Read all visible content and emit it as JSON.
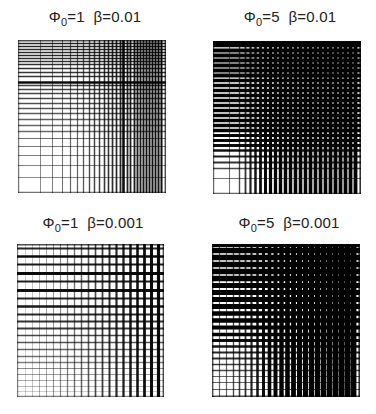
{
  "figure": {
    "panels": [
      {
        "id": "p1",
        "title": {
          "phi_symbol": "Φ",
          "phi_sub": "0",
          "phi_value": "=1",
          "beta": "β=0.01"
        },
        "phi0": 1,
        "beta": 0.01,
        "box": {
          "left": 18,
          "top": 40,
          "width": 148,
          "height": 153
        },
        "title_pos": {
          "left": 0,
          "top": 8
        },
        "v_lines": [
          [
            0,
            1.2,
            0.55
          ],
          [
            22,
            1.0,
            0.45
          ],
          [
            34,
            1.0,
            0.5
          ],
          [
            44,
            1.0,
            0.55
          ],
          [
            52,
            1.2,
            0.6
          ],
          [
            59,
            1.2,
            0.62
          ],
          [
            65,
            1.3,
            0.65
          ],
          [
            71,
            1.4,
            0.7
          ],
          [
            76,
            1.5,
            0.72
          ],
          [
            81,
            1.5,
            0.75
          ],
          [
            86,
            1.6,
            0.78
          ],
          [
            90,
            1.6,
            0.8
          ],
          [
            94,
            1.7,
            0.82
          ],
          [
            98,
            1.7,
            0.84
          ],
          [
            102,
            1.8,
            0.85
          ],
          [
            105,
            2.6,
            0.95
          ],
          [
            109,
            1.8,
            0.86
          ],
          [
            112,
            1.8,
            0.87
          ],
          [
            116,
            1.9,
            0.88
          ],
          [
            119,
            1.9,
            0.9
          ],
          [
            122,
            1.9,
            0.9
          ],
          [
            125,
            2.0,
            0.9
          ],
          [
            128,
            2.0,
            0.92
          ],
          [
            131,
            2.0,
            0.92
          ],
          [
            134,
            2.0,
            0.93
          ],
          [
            137,
            2.0,
            0.93
          ],
          [
            140,
            2.0,
            0.94
          ],
          [
            143,
            2.0,
            0.94
          ],
          [
            147,
            1.4,
            0.7
          ]
        ],
        "h_lines": [
          [
            0,
            1.4,
            0.7
          ],
          [
            3,
            1.6,
            0.85
          ],
          [
            6,
            1.6,
            0.85
          ],
          [
            9,
            1.6,
            0.84
          ],
          [
            12,
            1.6,
            0.83
          ],
          [
            15,
            1.6,
            0.83
          ],
          [
            18,
            1.6,
            0.82
          ],
          [
            21,
            1.6,
            0.8
          ],
          [
            24,
            1.6,
            0.8
          ],
          [
            28,
            1.6,
            0.8
          ],
          [
            32,
            1.6,
            0.78
          ],
          [
            36,
            1.6,
            0.78
          ],
          [
            42,
            2.6,
            0.95
          ],
          [
            45,
            1.5,
            0.75
          ],
          [
            49,
            1.5,
            0.72
          ],
          [
            53,
            1.5,
            0.72
          ],
          [
            58,
            1.5,
            0.7
          ],
          [
            63,
            1.5,
            0.68
          ],
          [
            68,
            1.4,
            0.66
          ],
          [
            73,
            1.4,
            0.64
          ],
          [
            79,
            1.4,
            0.62
          ],
          [
            85,
            1.3,
            0.6
          ],
          [
            91,
            1.3,
            0.58
          ],
          [
            98,
            1.2,
            0.55
          ],
          [
            106,
            1.2,
            0.52
          ],
          [
            115,
            1.1,
            0.5
          ],
          [
            125,
            1.0,
            0.48
          ],
          [
            137,
            1.0,
            0.45
          ],
          [
            152,
            1.2,
            0.55
          ]
        ]
      },
      {
        "id": "p2",
        "title": {
          "phi_symbol": "Φ",
          "phi_sub": "0",
          "phi_value": "=5",
          "beta": "β=0.01"
        },
        "phi0": 5,
        "beta": 0.01,
        "box": {
          "left": 213,
          "top": 41,
          "width": 148,
          "height": 153
        },
        "title_pos": {
          "left": 195,
          "top": 8
        },
        "v_lines": [
          [
            0,
            1.2,
            0.6
          ],
          [
            16,
            1.0,
            0.55
          ],
          [
            26,
            1.4,
            0.7
          ],
          [
            32,
            1.8,
            0.8
          ],
          [
            37,
            2.2,
            0.88
          ],
          [
            42,
            2.5,
            0.92
          ],
          [
            47,
            2.8,
            0.95
          ],
          [
            52,
            3.0,
            0.97
          ],
          [
            57,
            3.2,
            1
          ],
          [
            62,
            3.3,
            1
          ],
          [
            67,
            3.4,
            1
          ],
          [
            72,
            3.5,
            1
          ],
          [
            77,
            3.5,
            1
          ],
          [
            82,
            3.6,
            1
          ],
          [
            87,
            3.6,
            1
          ],
          [
            92,
            3.6,
            1
          ],
          [
            97,
            3.7,
            1
          ],
          [
            102,
            3.7,
            1
          ],
          [
            107,
            3.7,
            1
          ],
          [
            112,
            3.7,
            1
          ],
          [
            117,
            3.8,
            1
          ],
          [
            122,
            3.8,
            1
          ],
          [
            127,
            3.8,
            1
          ],
          [
            132,
            3.8,
            1
          ],
          [
            137,
            3.8,
            1
          ],
          [
            142,
            3.8,
            1
          ],
          [
            147,
            1.6,
            0.8
          ]
        ],
        "h_lines": [
          [
            0,
            3.0,
            1
          ],
          [
            4,
            3.6,
            1
          ],
          [
            9,
            3.8,
            1
          ],
          [
            14,
            3.8,
            1
          ],
          [
            19,
            3.8,
            1
          ],
          [
            24,
            3.8,
            1
          ],
          [
            29,
            3.8,
            1
          ],
          [
            34,
            3.8,
            1
          ],
          [
            39,
            3.7,
            1
          ],
          [
            44,
            3.7,
            1
          ],
          [
            49,
            3.7,
            1
          ],
          [
            54,
            3.7,
            1
          ],
          [
            59,
            3.6,
            1
          ],
          [
            64,
            3.6,
            1
          ],
          [
            69,
            3.6,
            1
          ],
          [
            74,
            3.5,
            1
          ],
          [
            79,
            3.5,
            1
          ],
          [
            84,
            3.4,
            1
          ],
          [
            89,
            3.3,
            1
          ],
          [
            94,
            3.2,
            1
          ],
          [
            99,
            3.0,
            0.97
          ],
          [
            104,
            2.8,
            0.95
          ],
          [
            109,
            2.5,
            0.92
          ],
          [
            115,
            2.2,
            0.88
          ],
          [
            121,
            1.8,
            0.8
          ],
          [
            127,
            1.4,
            0.7
          ],
          [
            137,
            1.0,
            0.55
          ],
          [
            152,
            1.2,
            0.6
          ]
        ]
      },
      {
        "id": "p3",
        "title": {
          "phi_symbol": "Φ",
          "phi_sub": "0",
          "phi_value": "=1",
          "beta": "β=0.001"
        },
        "phi0": 1,
        "beta": 0.001,
        "box": {
          "left": 17,
          "top": 244,
          "width": 147,
          "height": 153
        },
        "title_pos": {
          "left": -2,
          "top": 214
        },
        "v_lines": [
          [
            0,
            1.2,
            0.5
          ],
          [
            8,
            0.9,
            0.2
          ],
          [
            15,
            0.9,
            0.25
          ],
          [
            22,
            1.0,
            0.3
          ],
          [
            29,
            1.0,
            0.35
          ],
          [
            36,
            1.1,
            0.4
          ],
          [
            43,
            1.2,
            0.45
          ],
          [
            50,
            1.3,
            0.5
          ],
          [
            57,
            1.4,
            0.55
          ],
          [
            64,
            1.5,
            0.6
          ],
          [
            71,
            1.6,
            0.65
          ],
          [
            78,
            1.7,
            0.7
          ],
          [
            85,
            1.8,
            0.75
          ],
          [
            92,
            2.0,
            0.8
          ],
          [
            99,
            2.2,
            0.84
          ],
          [
            106,
            2.3,
            0.88
          ],
          [
            113,
            2.5,
            0.9
          ],
          [
            120,
            2.6,
            0.92
          ],
          [
            127,
            2.8,
            0.94
          ],
          [
            134,
            3.0,
            0.95
          ],
          [
            141,
            3.2,
            0.96
          ],
          [
            146,
            1.4,
            0.7
          ]
        ],
        "h_lines": [
          [
            0,
            1.4,
            0.7
          ],
          [
            4,
            2.0,
            0.85
          ],
          [
            12,
            2.6,
            0.95
          ],
          [
            20,
            2.2,
            0.9
          ],
          [
            29,
            3.0,
            0.96
          ],
          [
            37,
            2.2,
            0.88
          ],
          [
            46,
            2.8,
            0.94
          ],
          [
            54,
            2.0,
            0.85
          ],
          [
            62,
            2.4,
            0.9
          ],
          [
            70,
            2.0,
            0.84
          ],
          [
            77,
            2.0,
            0.8
          ],
          [
            84,
            1.8,
            0.76
          ],
          [
            91,
            1.7,
            0.72
          ],
          [
            98,
            1.6,
            0.66
          ],
          [
            105,
            1.5,
            0.6
          ],
          [
            112,
            1.4,
            0.55
          ],
          [
            118,
            1.3,
            0.5
          ],
          [
            124,
            1.2,
            0.45
          ],
          [
            130,
            1.1,
            0.38
          ],
          [
            136,
            1.0,
            0.32
          ],
          [
            142,
            1.0,
            0.28
          ],
          [
            147,
            0.9,
            0.22
          ],
          [
            152,
            1.2,
            0.5
          ]
        ]
      },
      {
        "id": "p4",
        "title": {
          "phi_symbol": "Φ",
          "phi_sub": "0",
          "phi_value": "=5",
          "beta": "β=0.001"
        },
        "phi0": 5,
        "beta": 0.001,
        "box": {
          "left": 212,
          "top": 244,
          "width": 148,
          "height": 153
        },
        "title_pos": {
          "left": 194,
          "top": 214
        },
        "v_lines": [
          [
            0,
            1.4,
            0.7
          ],
          [
            7,
            1.2,
            0.6
          ],
          [
            14,
            1.2,
            0.6
          ],
          [
            21,
            1.4,
            0.7
          ],
          [
            27,
            1.6,
            0.75
          ],
          [
            33,
            1.8,
            0.8
          ],
          [
            39,
            2.2,
            0.85
          ],
          [
            45,
            2.6,
            0.9
          ],
          [
            51,
            3.0,
            0.95
          ],
          [
            57,
            3.6,
            1
          ],
          [
            63,
            4.0,
            1
          ],
          [
            69,
            4.4,
            1
          ],
          [
            75,
            4.6,
            1
          ],
          [
            81,
            4.8,
            1
          ],
          [
            87,
            5.0,
            1
          ],
          [
            93,
            5.2,
            1
          ],
          [
            99,
            5.2,
            1
          ],
          [
            105,
            5.4,
            1
          ],
          [
            111,
            5.4,
            1
          ],
          [
            117,
            5.6,
            1
          ],
          [
            123,
            5.6,
            1
          ],
          [
            129,
            5.8,
            1
          ],
          [
            135,
            5.8,
            1
          ],
          [
            141,
            5.8,
            1
          ],
          [
            147,
            1.6,
            0.8
          ]
        ],
        "h_lines": [
          [
            0,
            3.0,
            1
          ],
          [
            6,
            5.6,
            1
          ],
          [
            13,
            5.6,
            1
          ],
          [
            20,
            5.6,
            1
          ],
          [
            27,
            5.4,
            1
          ],
          [
            34,
            5.4,
            1
          ],
          [
            41,
            5.2,
            1
          ],
          [
            48,
            5.2,
            1
          ],
          [
            55,
            5.0,
            1
          ],
          [
            62,
            4.8,
            1
          ],
          [
            69,
            4.6,
            1
          ],
          [
            76,
            4.4,
            1
          ],
          [
            83,
            4.0,
            1
          ],
          [
            90,
            3.6,
            1
          ],
          [
            96,
            3.0,
            0.95
          ],
          [
            102,
            2.6,
            0.9
          ],
          [
            108,
            2.2,
            0.85
          ],
          [
            114,
            1.8,
            0.8
          ],
          [
            120,
            1.6,
            0.75
          ],
          [
            126,
            1.4,
            0.7
          ],
          [
            132,
            1.2,
            0.6
          ],
          [
            138,
            1.2,
            0.6
          ],
          [
            145,
            1.2,
            0.6
          ],
          [
            152,
            1.4,
            0.7
          ]
        ]
      }
    ]
  }
}
